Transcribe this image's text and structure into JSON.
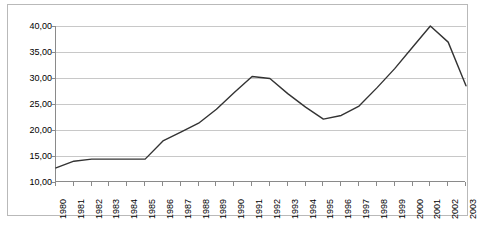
{
  "chart_data": {
    "type": "line",
    "title": "",
    "subtitle": "",
    "xlabel": "",
    "ylabel": "",
    "grid": "horizontal",
    "legend": "none",
    "ylim": [
      10,
      40
    ],
    "ytick_labels": [
      "40,00",
      "35,00",
      "30,00",
      "25,00",
      "20,00",
      "15,00",
      "10,00"
    ],
    "ytick_values": [
      40,
      35,
      30,
      25,
      20,
      15,
      10
    ],
    "decimal_separator": ",",
    "categories": [
      "1980",
      "1981",
      "1982",
      "1983",
      "1984",
      "1985",
      "1986",
      "1987",
      "1988",
      "1989",
      "1990",
      "1991",
      "1992",
      "1993",
      "1994",
      "1995",
      "1996",
      "1997",
      "1998",
      "1999",
      "2000",
      "2001",
      "2002",
      "2003"
    ],
    "values": [
      12.7,
      14.0,
      14.4,
      14.4,
      14.4,
      14.4,
      17.9,
      19.6,
      21.3,
      24.0,
      27.2,
      30.3,
      29.9,
      27.0,
      24.4,
      22.1,
      22.8,
      24.6,
      28.1,
      31.8,
      35.9,
      40.0,
      36.9,
      28.5
    ],
    "series": [
      {
        "name": "Series 1",
        "color": "#333333",
        "values": [
          12.7,
          14.0,
          14.4,
          14.4,
          14.4,
          14.4,
          17.9,
          19.6,
          21.3,
          24.0,
          27.2,
          30.3,
          29.9,
          27.0,
          24.4,
          22.1,
          22.8,
          24.6,
          28.1,
          31.8,
          35.9,
          40.0,
          36.9,
          28.5
        ]
      }
    ]
  },
  "style": {
    "background": "#ffffff",
    "gridline_color": "#c8c8c8",
    "axis_color": "#8a8a8a",
    "border_color": "#b9b9b9",
    "line_color": "#333333"
  }
}
